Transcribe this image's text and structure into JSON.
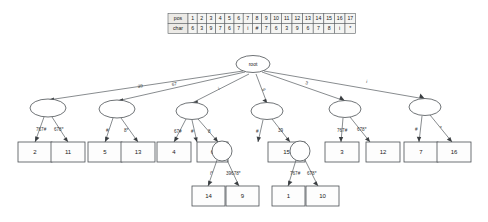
{
  "figure": {
    "type": "suffix-tree-diagram",
    "root_label": "root"
  },
  "table": {
    "row_headers": [
      "pos",
      "char"
    ],
    "positions": [
      "1",
      "2",
      "3",
      "4",
      "5",
      "6",
      "7",
      "8",
      "9",
      "10",
      "11",
      "12",
      "13",
      "14",
      "15",
      "16",
      "17"
    ],
    "chars": [
      "6",
      "3",
      "9",
      "7",
      "6",
      "7",
      "i",
      "#",
      "7",
      "6",
      "3",
      "9",
      "6",
      "7",
      "8",
      "i",
      "*"
    ]
  },
  "level1_edges": [
    {
      "label": "39",
      "target": "n1"
    },
    {
      "label": "67",
      "target": "n2"
    },
    {
      "label": "i",
      "target": "n3"
    },
    {
      "label": "6",
      "target": "n4"
    },
    {
      "label": "3",
      "target": "n5"
    },
    {
      "label": "i",
      "target": "n6"
    }
  ],
  "internal_nodes": [
    {
      "id": "n1",
      "children": [
        {
          "label": "767#",
          "leaf": "2"
        },
        {
          "label": "678*",
          "leaf": "11"
        }
      ]
    },
    {
      "id": "n2",
      "children": [
        {
          "label": "#",
          "leaf": "5"
        },
        {
          "label": "8*",
          "leaf": "13"
        }
      ]
    },
    {
      "id": "n3",
      "children": [
        {
          "label": "67#",
          "leaf": "4"
        },
        {
          "label": "#",
          "leaf": "6"
        },
        {
          "label": "8",
          "target": "n7"
        }
      ]
    },
    {
      "id": "n4",
      "children": [
        {
          "label": "#",
          "leaf": "15"
        },
        {
          "label": "39",
          "target": "n8"
        }
      ]
    },
    {
      "id": "n5",
      "children": [
        {
          "label": "767#",
          "leaf": "3"
        },
        {
          "label": "678*",
          "leaf": "12"
        }
      ]
    },
    {
      "id": "n6",
      "children": [
        {
          "label": "#",
          "leaf": "7"
        },
        {
          "label": "*",
          "leaf": "16"
        }
      ]
    },
    {
      "id": "n7",
      "children": [
        {
          "label": "i*",
          "leaf": "14"
        },
        {
          "label": "39678*",
          "leaf": "9"
        }
      ]
    },
    {
      "id": "n8",
      "children": [
        {
          "label": "767#",
          "leaf": "1"
        },
        {
          "label": "678*",
          "leaf": "10"
        }
      ]
    }
  ],
  "leaves": [
    "2",
    "11",
    "5",
    "13",
    "4",
    "6",
    "15",
    "3",
    "12",
    "7",
    "16",
    "14",
    "9",
    "1",
    "10"
  ]
}
